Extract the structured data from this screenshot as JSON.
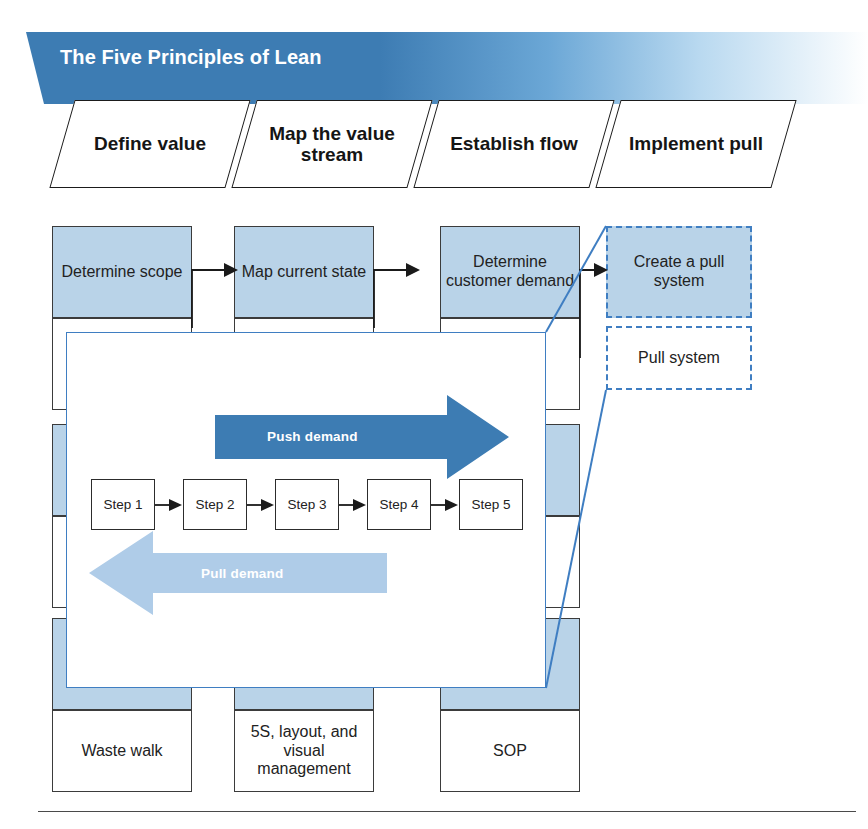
{
  "banner": {
    "title": "The Five Principles of Lean",
    "color": "#3d7cb3",
    "title_color": "#ffffff"
  },
  "principles": [
    {
      "label": "Define value"
    },
    {
      "label": "Map the value stream"
    },
    {
      "label": "Establish flow"
    },
    {
      "label": "Implement pull"
    }
  ],
  "matrix": {
    "columns": [
      {
        "key": "define-value",
        "highlighted": false,
        "cells": [
          {
            "text": "Determine scope",
            "fill": "blue"
          },
          {
            "text": "",
            "fill": "white"
          },
          {
            "text": "",
            "fill": "blue"
          },
          {
            "text": "",
            "fill": "white"
          },
          {
            "text": "Waste",
            "fill": "blue"
          },
          {
            "text": "Waste walk",
            "fill": "white"
          }
        ]
      },
      {
        "key": "map-the-value-stream",
        "highlighted": false,
        "cells": [
          {
            "text": "Map current state",
            "fill": "blue"
          },
          {
            "text": "Process",
            "fill": "white"
          },
          {
            "text": "",
            "fill": "blue"
          },
          {
            "text": "",
            "fill": "white"
          },
          {
            "text": "Fundamentals",
            "fill": "blue"
          },
          {
            "text": "5S, layout, and visual management",
            "fill": "white"
          }
        ]
      },
      {
        "key": "establish-flow",
        "highlighted": false,
        "cells": [
          {
            "text": "Determine customer demand",
            "fill": "blue"
          },
          {
            "text": "Takt time",
            "fill": "white"
          },
          {
            "text": "",
            "fill": "blue"
          },
          {
            "text": "",
            "fill": "white"
          },
          {
            "text": "the work",
            "fill": "blue"
          },
          {
            "text": "SOP",
            "fill": "white"
          }
        ]
      },
      {
        "key": "implement-pull",
        "highlighted": true,
        "cells": [
          {
            "text": "Create a pull system",
            "fill": "blue"
          },
          {
            "text": "Pull system",
            "fill": "white"
          }
        ]
      }
    ]
  },
  "callout": {
    "push_label": "Push demand",
    "pull_label": "Pull demand",
    "push_color": "#3d7cb3",
    "pull_color": "#afcce8",
    "border_color": "#3f7ec2",
    "steps": [
      {
        "label": "Step 1"
      },
      {
        "label": "Step 2"
      },
      {
        "label": "Step 3"
      },
      {
        "label": "Step 4"
      },
      {
        "label": "Step 5"
      }
    ]
  }
}
